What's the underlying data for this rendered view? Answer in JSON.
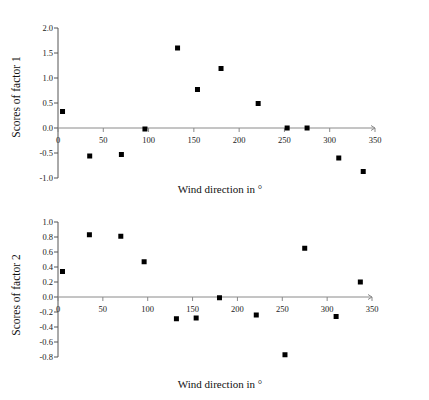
{
  "chart_data": [
    {
      "type": "scatter",
      "title": "",
      "xlabel": "Wind direction in °",
      "ylabel": "Scores of factor 1",
      "xlim": [
        0,
        350
      ],
      "ylim": [
        -1.0,
        2.0
      ],
      "xticks": [
        0,
        50,
        100,
        150,
        200,
        250,
        300,
        350
      ],
      "xtick_labels": [
        "0",
        "50",
        "100",
        "150",
        "200",
        "250",
        "300",
        "350"
      ],
      "yticks": [
        -1.0,
        -0.5,
        0.0,
        0.5,
        1.0,
        1.5,
        2.0
      ],
      "ytick_labels": [
        "-1.0",
        "-0.5",
        "0.0",
        "0.5",
        "1.0",
        "1.5",
        "2.0"
      ],
      "grid": false,
      "legend": false,
      "marker": "filled-square",
      "marker_color": "#000000",
      "x": [
        5,
        35,
        70,
        96,
        132,
        154,
        180,
        221,
        253,
        275,
        310,
        337
      ],
      "y": [
        0.33,
        -0.56,
        -0.53,
        -0.02,
        1.6,
        0.77,
        1.19,
        0.49,
        0.0,
        0.0,
        -0.6,
        -0.87
      ]
    },
    {
      "type": "scatter",
      "title": "",
      "xlabel": "Wind direction in °",
      "ylabel": "Scores of factor 2",
      "xlim": [
        0,
        350
      ],
      "ylim": [
        -0.8,
        1.0
      ],
      "xticks": [
        0,
        50,
        100,
        150,
        200,
        250,
        300,
        350
      ],
      "xtick_labels": [
        "0",
        "50",
        "100",
        "150",
        "200",
        "250",
        "300",
        "350"
      ],
      "yticks": [
        -0.8,
        -0.6,
        -0.4,
        -0.2,
        0.0,
        0.2,
        0.4,
        0.6,
        0.8,
        1.0
      ],
      "ytick_labels": [
        "-0.8",
        "-0.6",
        "-0.4",
        "-0.2",
        "0.0",
        "0.2",
        "0.4",
        "0.6",
        "0.8",
        "1.0"
      ],
      "grid": false,
      "legend": false,
      "marker": "filled-square",
      "marker_color": "#000000",
      "x": [
        5,
        35,
        70,
        96,
        132,
        154,
        180,
        221,
        253,
        275,
        310,
        337
      ],
      "y": [
        0.34,
        0.83,
        0.81,
        0.47,
        -0.29,
        -0.28,
        -0.01,
        -0.24,
        -0.77,
        0.65,
        -0.26,
        0.2
      ]
    }
  ],
  "figures": [
    {
      "id": "figure-1",
      "ylabel": "Scores of factor 1",
      "xlabel": "Wind direction in °"
    },
    {
      "id": "figure-2",
      "ylabel": "Scores of factor 2",
      "xlabel": "Wind direction in °"
    }
  ]
}
